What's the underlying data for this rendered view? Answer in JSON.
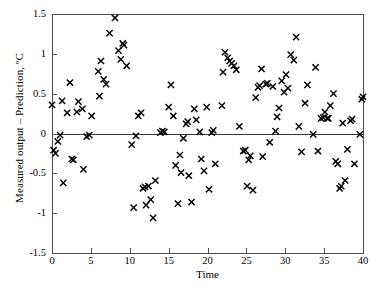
{
  "chart_data": {
    "type": "scatter",
    "title": "",
    "xlabel": "Time",
    "ylabel": "Measured output – Prediction, ºC",
    "xlim": [
      0,
      40
    ],
    "ylim": [
      -1.5,
      1.5
    ],
    "xticks": [
      0,
      5,
      10,
      15,
      20,
      25,
      30,
      35,
      40
    ],
    "xtick_labels": [
      "0",
      "5",
      "10",
      "15",
      "20",
      "25",
      "30",
      "35",
      "40"
    ],
    "yticks": [
      -1.5,
      -1,
      -0.5,
      0,
      0.5,
      1,
      1.5
    ],
    "ytick_labels": [
      "-1.5",
      "-1",
      "-0.5",
      "0",
      "0.5",
      "1",
      "1.5"
    ],
    "grid": false,
    "legend": null,
    "marker": "x",
    "marker_color": "#000000",
    "reference_line_y": 0,
    "frame": true,
    "points": [
      [
        0.0,
        0.36
      ],
      [
        0.2,
        -0.21
      ],
      [
        0.45,
        -0.25
      ],
      [
        0.75,
        -0.1
      ],
      [
        1.05,
        -0.02
      ],
      [
        1.3,
        0.41
      ],
      [
        1.45,
        -0.62
      ],
      [
        1.95,
        0.26
      ],
      [
        2.3,
        0.64
      ],
      [
        2.55,
        -0.32
      ],
      [
        2.75,
        -0.33
      ],
      [
        3.2,
        0.27
      ],
      [
        3.4,
        0.4
      ],
      [
        3.9,
        0.31
      ],
      [
        4.05,
        -0.45
      ],
      [
        4.45,
        -0.04
      ],
      [
        4.8,
        -0.02
      ],
      [
        5.1,
        0.22
      ],
      [
        5.95,
        0.78
      ],
      [
        6.1,
        0.47
      ],
      [
        6.3,
        0.91
      ],
      [
        6.65,
        0.68
      ],
      [
        6.95,
        0.62
      ],
      [
        7.4,
        1.26
      ],
      [
        8.1,
        1.45
      ],
      [
        8.55,
        1.04
      ],
      [
        8.85,
        0.93
      ],
      [
        9.1,
        1.13
      ],
      [
        9.25,
        1.11
      ],
      [
        9.6,
        0.85
      ],
      [
        10.25,
        -0.14
      ],
      [
        10.5,
        -0.93
      ],
      [
        10.8,
        -0.03
      ],
      [
        11.1,
        0.22
      ],
      [
        11.45,
        0.26
      ],
      [
        11.7,
        -0.69
      ],
      [
        11.95,
        -0.67
      ],
      [
        12.1,
        -0.9
      ],
      [
        12.4,
        -0.66
      ],
      [
        12.7,
        -0.83
      ],
      [
        13.0,
        -1.06
      ],
      [
        13.3,
        -0.59
      ],
      [
        13.95,
        0.01
      ],
      [
        14.2,
        0.03
      ],
      [
        14.45,
        0.02
      ],
      [
        15.0,
        0.33
      ],
      [
        15.3,
        0.61
      ],
      [
        15.6,
        0.22
      ],
      [
        15.9,
        -0.4
      ],
      [
        16.2,
        -0.88
      ],
      [
        16.45,
        -0.27
      ],
      [
        16.6,
        -0.49
      ],
      [
        16.9,
        -0.06
      ],
      [
        17.25,
        0.12
      ],
      [
        17.45,
        0.15
      ],
      [
        17.6,
        -0.53
      ],
      [
        17.95,
        -0.86
      ],
      [
        18.3,
        0.31
      ],
      [
        18.55,
        0.17
      ],
      [
        19.0,
        0.02
      ],
      [
        19.2,
        -0.32
      ],
      [
        19.55,
        -0.47
      ],
      [
        19.9,
        0.33
      ],
      [
        20.2,
        -0.7
      ],
      [
        20.55,
        0.01
      ],
      [
        20.75,
        0.04
      ],
      [
        21.0,
        -0.38
      ],
      [
        21.85,
        0.35
      ],
      [
        22.0,
        0.77
      ],
      [
        22.25,
        1.02
      ],
      [
        22.6,
        0.95
      ],
      [
        22.85,
        0.91
      ],
      [
        23.1,
        0.88
      ],
      [
        23.4,
        0.85
      ],
      [
        23.7,
        0.8
      ],
      [
        24.1,
        0.09
      ],
      [
        24.6,
        -0.22
      ],
      [
        24.85,
        -0.21
      ],
      [
        25.1,
        -0.66
      ],
      [
        25.3,
        -0.33
      ],
      [
        25.5,
        -0.28
      ],
      [
        25.85,
        -0.71
      ],
      [
        26.2,
        0.45
      ],
      [
        26.5,
        0.58
      ],
      [
        26.7,
        0.6
      ],
      [
        26.95,
        0.81
      ],
      [
        27.1,
        -0.29
      ],
      [
        27.5,
        0.62
      ],
      [
        27.7,
        0.63
      ],
      [
        28.0,
        -0.11
      ],
      [
        28.4,
        0.59
      ],
      [
        28.75,
        0.03
      ],
      [
        28.95,
        0.21
      ],
      [
        29.2,
        0.32
      ],
      [
        29.55,
        0.66
      ],
      [
        29.85,
        0.52
      ],
      [
        30.1,
        0.74
      ],
      [
        30.35,
        0.57
      ],
      [
        30.7,
        0.99
      ],
      [
        31.1,
        0.92
      ],
      [
        31.4,
        1.21
      ],
      [
        31.75,
        0.09
      ],
      [
        32.1,
        -0.23
      ],
      [
        32.55,
        0.38
      ],
      [
        32.85,
        0.61
      ],
      [
        33.6,
        -0.01
      ],
      [
        33.9,
        0.83
      ],
      [
        34.2,
        -0.22
      ],
      [
        34.6,
        0.19
      ],
      [
        34.9,
        0.2
      ],
      [
        35.1,
        0.27
      ],
      [
        35.4,
        0.19
      ],
      [
        35.55,
        0.19
      ],
      [
        35.8,
        0.35
      ],
      [
        36.2,
        0.5
      ],
      [
        36.5,
        -0.35
      ],
      [
        36.75,
        -0.38
      ],
      [
        37.0,
        -0.69
      ],
      [
        37.2,
        -0.66
      ],
      [
        37.4,
        0.13
      ],
      [
        37.7,
        -0.59
      ],
      [
        38.0,
        -0.2
      ],
      [
        38.4,
        0.16
      ],
      [
        38.6,
        0.18
      ],
      [
        38.9,
        -0.38
      ],
      [
        39.6,
        -0.01
      ],
      [
        39.85,
        0.43
      ],
      [
        40.0,
        0.46
      ]
    ]
  },
  "axes": {
    "plot_left_px": 52,
    "plot_right_px": 363,
    "plot_top_px": 14,
    "plot_bottom_px": 253
  }
}
